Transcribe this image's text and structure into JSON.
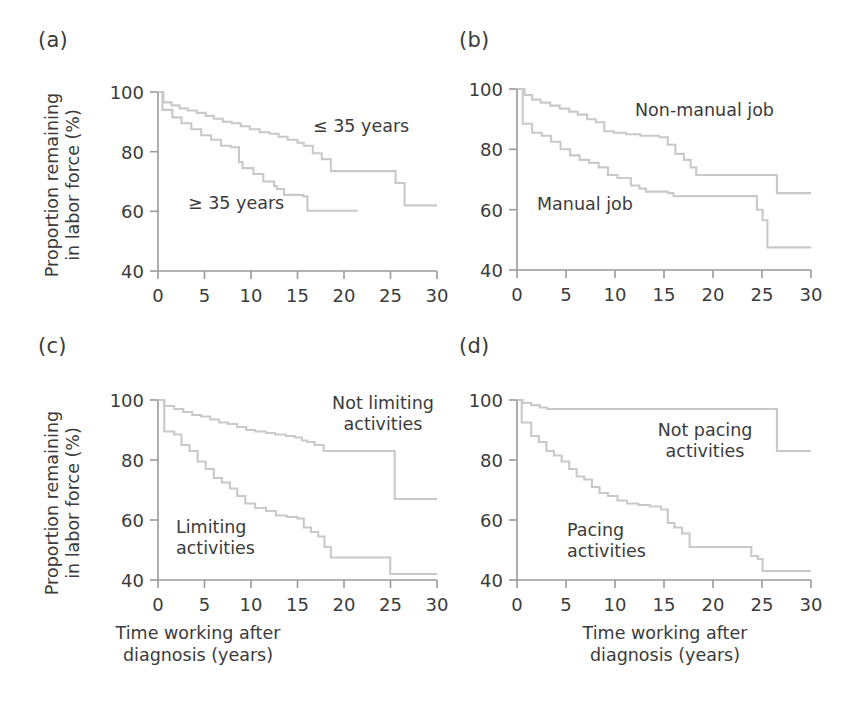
{
  "figure": {
    "background": "#ffffff",
    "line_color": "#c9c9c9",
    "axis_color": "#9a9a9a",
    "text_color": "#3b3b3b"
  },
  "axis_titles": {
    "y_line1": "Proportion remaining",
    "y_line2": "in labor force (%)",
    "x_line1": "Time working after",
    "x_line2": "diagnosis (years)"
  },
  "ticks": {
    "y": [
      "40",
      "60",
      "80",
      "100"
    ],
    "x": [
      "0",
      "5",
      "10",
      "15",
      "20",
      "25",
      "30"
    ]
  },
  "panels": {
    "a": {
      "label": "(a)",
      "series1": "≤ 35 years",
      "series2": "≥ 35 years"
    },
    "b": {
      "label": "(b)",
      "series1": "Non-manual job",
      "series2": "Manual job"
    },
    "c": {
      "label": "(c)",
      "series1_line1": "Not limiting",
      "series1_line2": "activities",
      "series2_line1": "Limiting",
      "series2_line2": "activities"
    },
    "d": {
      "label": "(d)",
      "series1_line1": "Not pacing",
      "series1_line2": "activities",
      "series2_line1": "Pacing",
      "series2_line2": "activities"
    }
  },
  "chart_data": [
    {
      "id": "a",
      "type": "line",
      "title": "(a)",
      "xlabel": "Time working after diagnosis (years)",
      "ylabel": "Proportion remaining in labor force (%)",
      "xlim": [
        0,
        31
      ],
      "ylim": [
        40,
        100
      ],
      "xticks": [
        0,
        5,
        10,
        15,
        20,
        25,
        30
      ],
      "yticks": [
        40,
        60,
        80,
        100
      ],
      "grid": false,
      "legend": "inline-annotations",
      "step": "post",
      "series": [
        {
          "name": "≤ 35 years",
          "x": [
            0,
            0.6,
            1.5,
            2.4,
            3.3,
            4.3,
            5.3,
            6.2,
            7.2,
            8.2,
            9.2,
            10.2,
            11.3,
            12.4,
            13.4,
            14.4,
            15.5,
            16.2,
            17.2,
            18.2,
            19.2,
            25.1,
            26.4,
            27.4,
            31
          ],
          "y": [
            100,
            96.5,
            95.5,
            94.5,
            93.8,
            93.0,
            92.0,
            91.0,
            90.0,
            89.5,
            88.5,
            87.5,
            86.5,
            86.0,
            85.0,
            84.0,
            83.0,
            82.0,
            79.5,
            77.5,
            73.5,
            73.5,
            69.5,
            62.0,
            62.0
          ]
        },
        {
          "name": "≥ 35 years",
          "x": [
            0,
            0.5,
            1.6,
            2.6,
            3.7,
            4.8,
            5.9,
            7.0,
            8.1,
            9.0,
            9.4,
            10.6,
            11.7,
            12.9,
            13.2,
            14.0,
            16.1,
            16.6,
            22.2
          ],
          "y": [
            100,
            94.0,
            91.5,
            89.5,
            87.5,
            85.5,
            84.0,
            82.0,
            81.5,
            76.5,
            74.5,
            72.5,
            70.0,
            68.5,
            67.5,
            65.5,
            65.0,
            60.2,
            60.2
          ]
        }
      ]
    },
    {
      "id": "b",
      "type": "line",
      "title": "(b)",
      "xlabel": "Time working after diagnosis (years)",
      "ylabel": "Proportion remaining in labor force (%)",
      "xlim": [
        0,
        31
      ],
      "ylim": [
        40,
        100
      ],
      "xticks": [
        0,
        5,
        10,
        15,
        20,
        25,
        30
      ],
      "yticks": [
        40,
        60,
        80,
        100
      ],
      "grid": false,
      "legend": "inline-annotations",
      "step": "post",
      "series": [
        {
          "name": "Non-manual job",
          "x": [
            0,
            0.8,
            1.6,
            2.5,
            3.5,
            4.5,
            5.5,
            6.4,
            7.4,
            8.3,
            9.2,
            10.2,
            11.5,
            13.0,
            15.0,
            15.9,
            16.7,
            17.6,
            18.3,
            18.9,
            26.5,
            27.4,
            31
          ],
          "y": [
            100,
            98.0,
            96.5,
            95.5,
            94.5,
            93.5,
            92.5,
            91.5,
            90.0,
            89.0,
            86.0,
            85.5,
            85.0,
            84.5,
            84.0,
            81.5,
            78.5,
            76.5,
            74.0,
            71.5,
            71.5,
            65.5,
            65.5
          ]
        },
        {
          "name": "Manual job",
          "x": [
            0,
            0.6,
            1.6,
            2.6,
            3.6,
            4.6,
            5.6,
            6.6,
            7.6,
            8.6,
            9.6,
            10.6,
            12.0,
            12.9,
            13.6,
            15.9,
            16.5,
            24.6,
            25.3,
            25.9,
            26.4,
            31
          ],
          "y": [
            100,
            88.5,
            85.5,
            84.5,
            82.5,
            80.0,
            78.0,
            76.5,
            75.5,
            74.0,
            71.5,
            70.5,
            68.0,
            67.0,
            66.0,
            65.5,
            64.5,
            64.5,
            60.0,
            56.5,
            47.5,
            47.5
          ]
        }
      ]
    },
    {
      "id": "c",
      "type": "line",
      "title": "(c)",
      "xlabel": "Time working after diagnosis (years)",
      "ylabel": "Proportion remaining in labor force (%)",
      "xlim": [
        0,
        31
      ],
      "ylim": [
        40,
        100
      ],
      "xticks": [
        0,
        5,
        10,
        15,
        20,
        25,
        30
      ],
      "yticks": [
        40,
        60,
        80,
        100
      ],
      "grid": false,
      "legend": "inline-annotations",
      "step": "post",
      "series": [
        {
          "name": "Not limiting activities",
          "x": [
            0,
            0.7,
            1.8,
            2.8,
            3.8,
            4.8,
            5.8,
            6.8,
            7.8,
            8.8,
            9.8,
            10.8,
            12.0,
            13.0,
            14.2,
            15.2,
            16.0,
            16.6,
            17.4,
            18.4,
            19.0,
            25.8,
            26.3,
            31
          ],
          "y": [
            100,
            98.0,
            97.0,
            96.0,
            95.0,
            94.5,
            93.5,
            92.5,
            92.0,
            91.0,
            90.0,
            89.5,
            89.0,
            88.5,
            88.0,
            87.5,
            86.5,
            86.0,
            85.0,
            83.0,
            83.0,
            83.0,
            67.0,
            67.0
          ]
        },
        {
          "name": "Limiting activities",
          "x": [
            0,
            0.7,
            1.8,
            2.6,
            3.5,
            4.4,
            5.3,
            6.2,
            7.1,
            8.0,
            8.8,
            9.7,
            10.8,
            12.0,
            13.1,
            14.3,
            15.5,
            16.2,
            17.0,
            17.8,
            18.5,
            19.2,
            25.0,
            25.8,
            31
          ],
          "y": [
            100,
            89.5,
            88.5,
            85.0,
            83.0,
            79.5,
            77.0,
            74.0,
            72.5,
            70.5,
            68.0,
            65.5,
            64.0,
            63.0,
            61.5,
            61.0,
            60.5,
            57.5,
            56.0,
            54.5,
            51.0,
            47.5,
            47.5,
            42.0,
            42.0
          ]
        }
      ]
    },
    {
      "id": "d",
      "type": "line",
      "title": "(d)",
      "xlabel": "Time working after diagnosis (years)",
      "ylabel": "Proportion remaining in labor force (%)",
      "xlim": [
        0,
        31
      ],
      "ylim": [
        40,
        100
      ],
      "xticks": [
        0,
        5,
        10,
        15,
        20,
        25,
        30
      ],
      "yticks": [
        40,
        60,
        80,
        100
      ],
      "grid": false,
      "legend": "inline-annotations",
      "step": "post",
      "series": [
        {
          "name": "Not pacing activities",
          "x": [
            0,
            0.6,
            1.5,
            2.4,
            3.2,
            26.8,
            27.4,
            31
          ],
          "y": [
            100,
            99.0,
            98.3,
            97.5,
            97.0,
            97.0,
            83.0,
            83.0
          ]
        },
        {
          "name": "Pacing activities",
          "x": [
            0,
            0.5,
            1.5,
            2.3,
            3.1,
            3.9,
            4.7,
            5.5,
            6.3,
            7.1,
            7.9,
            8.7,
            9.6,
            10.6,
            11.6,
            12.8,
            14.0,
            15.2,
            15.9,
            16.6,
            17.4,
            18.2,
            18.9,
            23.8,
            24.7,
            25.4,
            25.9,
            31
          ],
          "y": [
            100,
            92.5,
            88.0,
            86.0,
            83.0,
            81.5,
            79.5,
            77.0,
            74.5,
            73.5,
            71.0,
            69.0,
            68.0,
            66.5,
            65.5,
            65.0,
            64.5,
            63.5,
            59.0,
            57.5,
            55.5,
            51.0,
            51.0,
            51.0,
            48.0,
            47.0,
            43.0,
            43.0
          ]
        }
      ]
    }
  ]
}
